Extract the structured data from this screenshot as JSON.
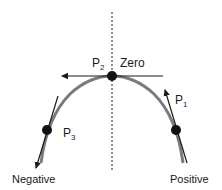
{
  "diagram": {
    "colors": {
      "line": "#1a1a1a",
      "arc": "#7a7a7a",
      "point": "#111111"
    },
    "axis": {
      "style": "dashed",
      "orientation": "vertical"
    },
    "points": [
      {
        "id": "P1",
        "label_main": "P",
        "label_sub": "1",
        "position": "right side of arc",
        "tangent_arrow": "up"
      },
      {
        "id": "P2",
        "label_main": "P",
        "label_sub": "2",
        "position": "top of arc",
        "tangent_arrow": "left"
      },
      {
        "id": "P3",
        "label_main": "P",
        "label_sub": "3",
        "position": "left side of arc",
        "tangent_arrow": "down"
      }
    ],
    "labels": {
      "zero": "Zero",
      "negative": "Negative",
      "positive": "Positive"
    }
  }
}
